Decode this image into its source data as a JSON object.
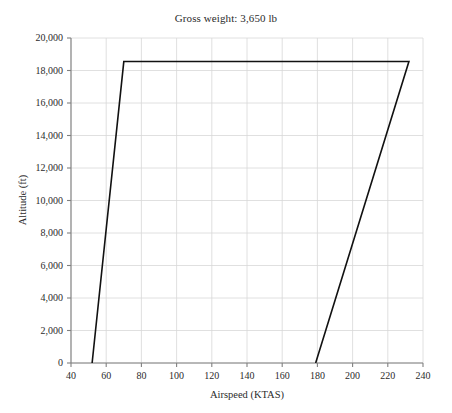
{
  "chart_data": {
    "type": "line",
    "title": "Gross weight: 3,650 lb",
    "xlabel": "Airspeed (KTAS)",
    "ylabel": "Altitude (ft)",
    "xlim": [
      40,
      240
    ],
    "ylim": [
      0,
      20000
    ],
    "xticks": [
      40,
      60,
      80,
      100,
      120,
      140,
      160,
      180,
      200,
      220,
      240
    ],
    "xtick_labels": [
      "40",
      "60",
      "80",
      "100",
      "120",
      "140",
      "160",
      "180",
      "200",
      "220",
      "240"
    ],
    "yticks": [
      0,
      2000,
      4000,
      6000,
      8000,
      10000,
      12000,
      14000,
      16000,
      18000,
      20000
    ],
    "ytick_labels": [
      "0",
      "2,000",
      "4,000",
      "6,000",
      "8,000",
      "10,000",
      "12,000",
      "14,000",
      "16,000",
      "18,000",
      "20,000"
    ],
    "grid": true,
    "legend": "none",
    "series": [
      {
        "name": "Flight envelope",
        "color": "#111111",
        "line_width": 1.6,
        "x": [
          52,
          70,
          232,
          179
        ],
        "y": [
          0,
          18550,
          18550,
          0
        ],
        "points": [
          {
            "x": 52,
            "y": 0,
            "label": "stall-speed-sea-level"
          },
          {
            "x": 70,
            "y": 18550,
            "label": "stall-speed-ceiling"
          },
          {
            "x": 232,
            "y": 18550,
            "label": "max-speed-ceiling"
          },
          {
            "x": 179,
            "y": 0,
            "label": "max-speed-sea-level"
          }
        ]
      }
    ],
    "annotations": []
  },
  "style": {
    "background_color": "#ffffff",
    "grid_color": "#d8d8d8",
    "axis_color": "#808080",
    "text_color": "#2b2b2b",
    "curve_color": "#111111"
  }
}
